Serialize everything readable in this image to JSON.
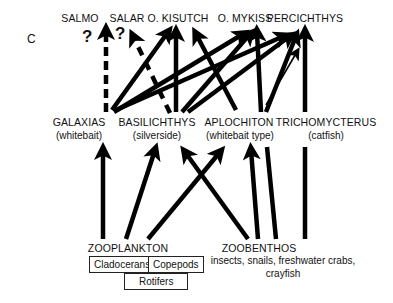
{
  "panel_label": "C",
  "top_level": [
    {
      "id": "salmo",
      "label": "SALMO"
    },
    {
      "id": "salar",
      "label": "SALAR"
    },
    {
      "id": "kisutch",
      "label": "O. KISUTCH"
    },
    {
      "id": "mykiss",
      "label": "O. MYKISS"
    },
    {
      "id": "percichthys",
      "label": "PERCICHTHYS"
    }
  ],
  "question_marks": [
    "?",
    "?"
  ],
  "mid_level": [
    {
      "id": "galaxias",
      "label": "GALAXIAS",
      "sub": "(whitebait)"
    },
    {
      "id": "basilichthys",
      "label": "BASILICHTHYS",
      "sub": "(silverside)"
    },
    {
      "id": "aplochiton",
      "label": "APLOCHITON",
      "sub": "(whitebait type)"
    },
    {
      "id": "trichomycterus",
      "label": "TRICHOMYCTERUS",
      "sub": "(catfish)"
    }
  ],
  "bottom_level": {
    "zooplankton": {
      "label": "ZOOPLANKTON",
      "groups": [
        "Cladocerans",
        "Copepods",
        "Rotifers"
      ]
    },
    "zoobenthos": {
      "label": "ZOOBENTHOS",
      "desc_line1": "insects, snails, freshwater crabs,",
      "desc_line2": "crayfish"
    }
  },
  "edges": [
    {
      "from": "galaxias",
      "to": "salmo",
      "style": "dashed"
    },
    {
      "from": "basilichthys",
      "to": "salar",
      "style": "dashed"
    },
    {
      "from": "galaxias",
      "to": "kisutch",
      "style": "solid"
    },
    {
      "from": "basilichthys",
      "to": "kisutch",
      "style": "solid"
    },
    {
      "from": "aplochiton",
      "to": "kisutch",
      "style": "solid"
    },
    {
      "from": "galaxias",
      "to": "mykiss",
      "style": "solid"
    },
    {
      "from": "basilichthys",
      "to": "mykiss",
      "style": "solid"
    },
    {
      "from": "aplochiton",
      "to": "mykiss",
      "style": "solid"
    },
    {
      "from": "galaxias",
      "to": "percichthys",
      "style": "solid"
    },
    {
      "from": "basilichthys",
      "to": "percichthys",
      "style": "solid"
    },
    {
      "from": "aplochiton",
      "to": "percichthys",
      "style": "solid"
    },
    {
      "from": "trichomycterus",
      "to": "percichthys",
      "style": "thin"
    },
    {
      "from": "zooplankton",
      "to": "galaxias",
      "style": "solid"
    },
    {
      "from": "zooplankton",
      "to": "basilichthys",
      "style": "solid"
    },
    {
      "from": "zooplankton",
      "to": "aplochiton",
      "style": "solid"
    },
    {
      "from": "zoobenthos",
      "to": "basilichthys",
      "style": "solid"
    },
    {
      "from": "zoobenthos",
      "to": "aplochiton",
      "style": "solid"
    },
    {
      "from": "zoobenthos",
      "to": "trichomycterus",
      "style": "solid"
    }
  ]
}
